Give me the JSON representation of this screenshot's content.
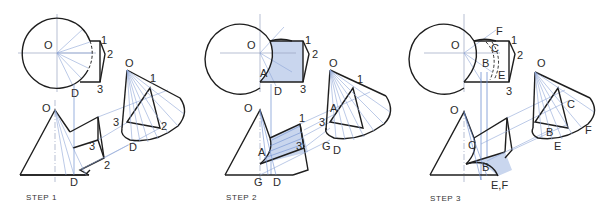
{
  "figure": {
    "colors": {
      "outline": "#1e1e1e",
      "construction": "#8fa6d6",
      "projection": "#6f8fd0",
      "shade": "#c9d6ee",
      "centerline": "#9aa4c0"
    },
    "steps": [
      {
        "label": "STEP 1",
        "top_view_labels": {
          "o": "O",
          "p1": "1",
          "p2": "2",
          "p3": "3",
          "d": "D"
        },
        "front_view_labels": {
          "o": "O",
          "p2": "2",
          "p3a": "3",
          "p3b": "3",
          "d": "D"
        },
        "aux_view_labels": {
          "o": "O",
          "p1": "1",
          "p2": "2",
          "d": "D"
        }
      },
      {
        "label": "STEP 2",
        "top_view_labels": {
          "o": "O",
          "p1": "1",
          "p2": "2",
          "p3": "3",
          "a": "A",
          "d": "D"
        },
        "front_view_labels": {
          "o": "O",
          "p1": "1",
          "p3": "3",
          "a": "A",
          "g": "G",
          "d": "D"
        },
        "aux_view_labels": {
          "o": "O",
          "p1": "1",
          "a": "A",
          "p3": "3",
          "g": "G",
          "d": "D"
        }
      },
      {
        "label": "STEP 3",
        "top_view_labels": {
          "o": "O",
          "p1": "1",
          "p2": "2",
          "p3": "3",
          "f": "F",
          "c": "C",
          "b": "B",
          "e": "E"
        },
        "front_view_labels": {
          "o": "O",
          "c": "C",
          "b": "B",
          "ef": "E,F"
        },
        "aux_view_labels": {
          "o": "O",
          "c": "C",
          "b": "B",
          "e": "E",
          "f": "F"
        }
      }
    ]
  }
}
